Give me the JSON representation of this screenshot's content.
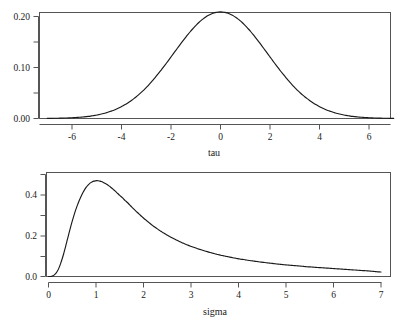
{
  "figure": {
    "background_color": "#ffffff",
    "line_color": "#1a1a1a",
    "axis_color": "#555555",
    "panel_count": 2
  },
  "chart_data": [
    {
      "type": "line",
      "id": "tau-density",
      "title": "",
      "subtitle": "",
      "xlabel": "tau",
      "ylabel": "",
      "xlim": [
        -7,
        7
      ],
      "ylim": [
        0,
        0.215
      ],
      "grid": false,
      "legend": null,
      "x_ticks": [
        -6,
        -4,
        -2,
        0,
        2,
        4,
        6
      ],
      "x_ticklabels": [
        "-6",
        "-4",
        "-2",
        "0",
        "2",
        "4",
        "6"
      ],
      "x_minor_ticks": [],
      "y_ticks": [
        0.0,
        0.05,
        0.1,
        0.15,
        0.2
      ],
      "y_ticklabels": [
        "0.00",
        "",
        "0.10",
        "",
        "0.20"
      ],
      "description": "symmetric bell-shaped density centred at 0, peak 0.209",
      "peak_x": 0,
      "peak_y": 0.209,
      "x": [
        -7.0,
        -6.75,
        -6.5,
        -6.25,
        -6.0,
        -5.75,
        -5.5,
        -5.25,
        -5.0,
        -4.75,
        -4.5,
        -4.25,
        -4.0,
        -3.75,
        -3.5,
        -3.25,
        -3.0,
        -2.75,
        -2.5,
        -2.25,
        -2.0,
        -1.75,
        -1.5,
        -1.25,
        -1.0,
        -0.75,
        -0.5,
        -0.25,
        0.0,
        0.25,
        0.5,
        0.75,
        1.0,
        1.25,
        1.5,
        1.75,
        2.0,
        2.25,
        2.5,
        2.75,
        3.0,
        3.25,
        3.5,
        3.75,
        4.0,
        4.25,
        4.5,
        4.75,
        5.0,
        5.25,
        5.5,
        5.75,
        6.0,
        6.25,
        6.5,
        6.75,
        7.0
      ],
      "y": [
        0.0051,
        0.0063,
        0.0078,
        0.0096,
        0.0117,
        0.0142,
        0.0171,
        0.0205,
        0.0244,
        0.0288,
        0.0338,
        0.0394,
        0.0456,
        0.0524,
        0.0598,
        0.0677,
        0.0761,
        0.0849,
        0.0939,
        0.1031,
        0.1123,
        0.1213,
        0.13,
        0.1382,
        0.1457,
        0.1524,
        0.1581,
        0.1627,
        0.166,
        0.1627,
        0.1581,
        0.1524,
        0.1457,
        0.1382,
        0.13,
        0.1213,
        0.1123,
        0.1031,
        0.0939,
        0.0849,
        0.0761,
        0.0677,
        0.0598,
        0.0524,
        0.0456,
        0.0394,
        0.0338,
        0.0288,
        0.0244,
        0.0205,
        0.0171,
        0.0142,
        0.0117,
        0.0096,
        0.0078,
        0.0063,
        0.0051
      ]
    },
    {
      "type": "line",
      "id": "sigma-density",
      "title": "",
      "subtitle": "",
      "xlabel": "sigma",
      "ylabel": "",
      "xlim": [
        0,
        7
      ],
      "ylim": [
        0,
        0.49
      ],
      "grid": false,
      "legend": null,
      "x_ticks": [
        0,
        1,
        2,
        3,
        4,
        5,
        6,
        7
      ],
      "x_ticklabels": [
        "0",
        "1",
        "2",
        "3",
        "4",
        "5",
        "6",
        "7"
      ],
      "x_minor_ticks": [],
      "y_ticks": [
        0.0,
        0.1,
        0.2,
        0.3,
        0.4,
        0.5
      ],
      "y_ticklabels": [
        "0.0",
        "",
        "0.2",
        "",
        "0.4",
        ""
      ],
      "description": "right-skewed heavy-tailed density on positive support, rises steeply from 0, peaks near sigma = 1 at about 0.47, long slowly decaying tail",
      "peak_x": 1.0,
      "peak_y": 0.47,
      "x": [
        0.0,
        0.1,
        0.2,
        0.3,
        0.4,
        0.5,
        0.6,
        0.7,
        0.8,
        0.9,
        1.0,
        1.1,
        1.2,
        1.3,
        1.4,
        1.5,
        1.6,
        1.8,
        2.0,
        2.2,
        2.4,
        2.6,
        2.8,
        3.0,
        3.2,
        3.4,
        3.6,
        3.8,
        4.0,
        4.25,
        4.5,
        4.75,
        5.0,
        5.25,
        5.5,
        5.75,
        6.0,
        6.25,
        6.5,
        6.75,
        7.0
      ],
      "y": [
        0.0,
        0.004,
        0.032,
        0.096,
        0.184,
        0.272,
        0.345,
        0.4,
        0.44,
        0.462,
        0.47,
        0.467,
        0.456,
        0.44,
        0.42,
        0.398,
        0.375,
        0.33,
        0.287,
        0.249,
        0.217,
        0.19,
        0.167,
        0.148,
        0.132,
        0.118,
        0.106,
        0.096,
        0.087,
        0.078,
        0.07,
        0.063,
        0.057,
        0.052,
        0.047,
        0.043,
        0.039,
        0.035,
        0.031,
        0.027,
        0.022
      ]
    }
  ]
}
